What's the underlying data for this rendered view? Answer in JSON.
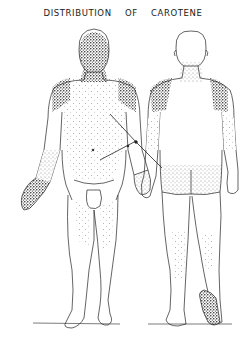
{
  "title": "DISTRIBUTION OF CAROTENE",
  "figures": [
    {
      "view": "front",
      "label": "anterior view",
      "stippled_regions": [
        "face",
        "neck",
        "shoulders",
        "chest",
        "abdomen",
        "forearms",
        "palms",
        "inner thighs",
        "shins"
      ]
    },
    {
      "view": "back",
      "label": "posterior view",
      "stippled_regions": [
        "nape of neck",
        "shoulders",
        "back of arms",
        "buttocks",
        "back of thighs",
        "calves",
        "sole of foot"
      ]
    }
  ],
  "annotations": {
    "arrows": 2,
    "description": "Two leader lines crossing between the figures pointing to shaded regions"
  },
  "colors": {
    "ink": "#1a1a1a",
    "background": "#ffffff"
  }
}
